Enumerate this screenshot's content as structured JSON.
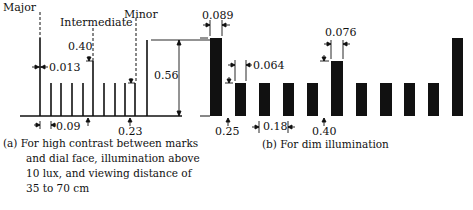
{
  "figure": {
    "panel_a": {
      "labels": {
        "major": "Major",
        "intermediate": "Intermediate",
        "minor": "Minor"
      },
      "dimensions": {
        "mark_width": "0.013",
        "intermediate_height": "0.40",
        "major_height": "0.56",
        "minor_spacing": "0.09",
        "minor_height": "0.23"
      },
      "caption": {
        "line1": "(a) For high contrast between marks",
        "line2": "and dial face, illumination above",
        "line3": "10 lux, and viewing distance of",
        "line4": "35 to 70 cm"
      }
    },
    "panel_b": {
      "dimensions": {
        "major_width": "0.089",
        "minor_width": "0.064",
        "intermediate_width": "0.076",
        "minor_height": "0.25",
        "minor_spacing": "0.18",
        "intermediate_height": "0.40"
      },
      "caption": "(b) For dim illumination"
    }
  }
}
